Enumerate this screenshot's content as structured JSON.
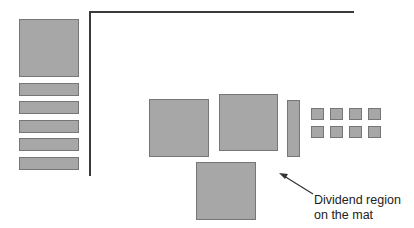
{
  "diagram": {
    "title": "",
    "colors": {
      "block_fill": "#a7a7a7",
      "block_border": "#767676",
      "line": "#3a3a3a",
      "text": "#222222"
    },
    "annotation": {
      "line1": "Dividend region",
      "line2": "on the mat",
      "arrow_icon": "arrow-pointer-icon"
    },
    "left_column": {
      "large_square": 1,
      "bars": 5
    },
    "mat_region": {
      "large_squares": 3,
      "vertical_bar": 1,
      "small_squares_grid": "2x4"
    }
  }
}
